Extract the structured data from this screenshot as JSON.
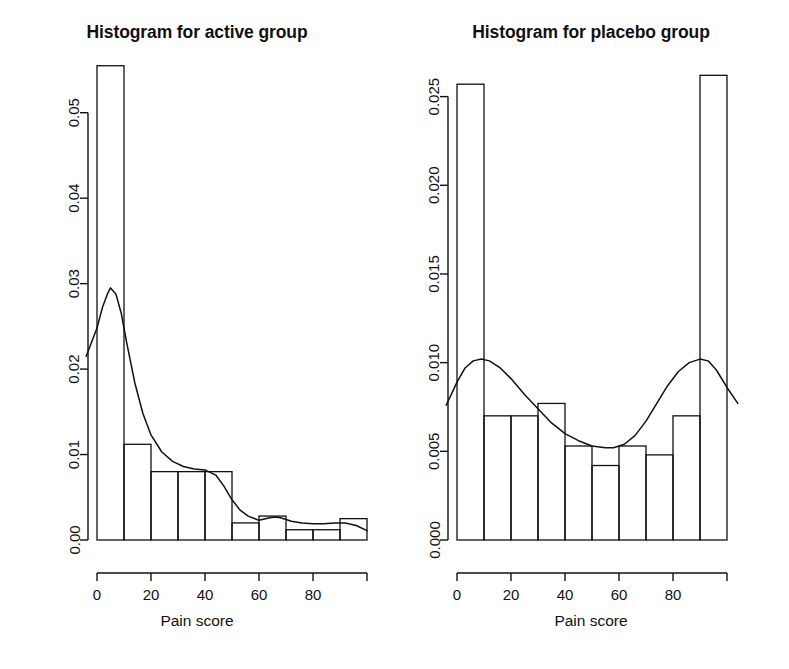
{
  "figure": {
    "background": "#ffffff",
    "ink": "#111111",
    "panels": 2
  },
  "panels": [
    {
      "id": "active",
      "title": "Histogram for active group",
      "xlabel": "Pain score",
      "ylabel": "",
      "ytick_labels": [
        "0.00",
        "0.01",
        "0.02",
        "0.03",
        "0.04",
        "0.05"
      ],
      "xtick_labels": [
        "0",
        "20",
        "40",
        "60",
        "80"
      ]
    },
    {
      "id": "placebo",
      "title": "Histogram for placebo group",
      "xlabel": "Pain score",
      "ylabel": "",
      "ytick_labels": [
        "0.000",
        "0.005",
        "0.010",
        "0.015",
        "0.020",
        "0.025"
      ],
      "xtick_labels": [
        "0",
        "20",
        "40",
        "60",
        "80"
      ]
    }
  ],
  "chart_data": [
    {
      "type": "bar",
      "id": "active",
      "title": "Histogram for active group",
      "xlabel": "Pain score",
      "ylabel": "",
      "grid": false,
      "legend": "none",
      "xlim": [
        0,
        100
      ],
      "ylim": [
        0,
        0.055
      ],
      "yticks": [
        0.0,
        0.01,
        0.02,
        0.03,
        0.04,
        0.05
      ],
      "ytick_labels": [
        "0.00",
        "0.01",
        "0.02",
        "0.03",
        "0.04",
        "0.05"
      ],
      "xticks": [
        0,
        20,
        40,
        60,
        80
      ],
      "xtick_labels": [
        "0",
        "20",
        "40",
        "60",
        "80"
      ],
      "bin_width": 10,
      "bin_edges": [
        0,
        10,
        20,
        30,
        40,
        50,
        60,
        70,
        80,
        90,
        100
      ],
      "categories": [
        "0-10",
        "10-20",
        "20-30",
        "30-40",
        "40-50",
        "50-60",
        "60-70",
        "70-80",
        "80-90",
        "90-100"
      ],
      "values": [
        0.0555,
        0.0112,
        0.008,
        0.008,
        0.008,
        0.002,
        0.0028,
        0.0012,
        0.0012,
        0.0025
      ],
      "overlay": {
        "type": "line",
        "name": "density",
        "x": [
          -4,
          0,
          2,
          4,
          5,
          7,
          9,
          11,
          14,
          17,
          20,
          24,
          28,
          32,
          36,
          40,
          44,
          47,
          50,
          53,
          56,
          60,
          64,
          66,
          68,
          72,
          76,
          80,
          84,
          88,
          92,
          96,
          100
        ],
        "y": [
          0.0215,
          0.0248,
          0.0272,
          0.0289,
          0.0295,
          0.0288,
          0.0265,
          0.0231,
          0.0184,
          0.0148,
          0.0123,
          0.0103,
          0.0092,
          0.0086,
          0.0083,
          0.0082,
          0.0076,
          0.0063,
          0.0047,
          0.0035,
          0.0028,
          0.0023,
          0.0026,
          0.0027,
          0.0026,
          0.0022,
          0.002,
          0.0019,
          0.0019,
          0.002,
          0.002,
          0.0017,
          0.0011
        ]
      }
    },
    {
      "type": "bar",
      "id": "placebo",
      "title": "Histogram for placebo group",
      "xlabel": "Pain score",
      "ylabel": "",
      "grid": false,
      "legend": "none",
      "xlim": [
        0,
        100
      ],
      "ylim": [
        0,
        0.0265
      ],
      "yticks": [
        0.0,
        0.005,
        0.01,
        0.015,
        0.02,
        0.025
      ],
      "ytick_labels": [
        "0.000",
        "0.005",
        "0.010",
        "0.015",
        "0.020",
        "0.025"
      ],
      "xticks": [
        0,
        20,
        40,
        60,
        80
      ],
      "xtick_labels": [
        "0",
        "20",
        "40",
        "60",
        "80"
      ],
      "bin_width": 10,
      "bin_edges": [
        0,
        10,
        20,
        30,
        40,
        50,
        60,
        70,
        80,
        90,
        100
      ],
      "categories": [
        "0-10",
        "10-20",
        "20-30",
        "30-40",
        "40-50",
        "50-60",
        "60-70",
        "70-80",
        "80-90",
        "90-100"
      ],
      "values": [
        0.0257,
        0.007,
        0.007,
        0.0077,
        0.0053,
        0.0042,
        0.0053,
        0.0048,
        0.007,
        0.0262
      ],
      "overlay": {
        "type": "line",
        "name": "density",
        "x": [
          -4,
          0,
          3,
          6,
          9,
          12,
          16,
          20,
          25,
          30,
          35,
          40,
          45,
          50,
          55,
          58,
          62,
          66,
          70,
          74,
          78,
          82,
          86,
          90,
          93,
          96,
          100,
          104
        ],
        "y": [
          0.0076,
          0.0089,
          0.0097,
          0.0101,
          0.0102,
          0.0101,
          0.0097,
          0.0091,
          0.0082,
          0.0074,
          0.0066,
          0.006,
          0.0056,
          0.0053,
          0.0052,
          0.0052,
          0.0054,
          0.0059,
          0.0067,
          0.0077,
          0.0087,
          0.0095,
          0.01,
          0.0102,
          0.0101,
          0.0096,
          0.0086,
          0.0077
        ]
      }
    }
  ]
}
